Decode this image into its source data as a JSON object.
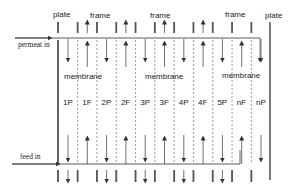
{
  "title_labels": {
    "plate_left": "plate",
    "frame_1": "frame",
    "frame_2": "frame",
    "frame_3": "frame",
    "plate_right": "plate"
  },
  "flows": {
    "permeat_in": "permeat in",
    "feed_in": "feed in"
  },
  "membrane_labels": [
    "membrane",
    "membrane",
    "membrane"
  ],
  "columns": [
    {
      "label": "1P",
      "type": "P"
    },
    {
      "label": "1F",
      "type": "F"
    },
    {
      "label": "2P",
      "type": "P"
    },
    {
      "label": "2F",
      "type": "F"
    },
    {
      "label": "3P",
      "type": "P"
    },
    {
      "label": "3F",
      "type": "F"
    },
    {
      "label": "4P",
      "type": "P"
    },
    {
      "label": "4F",
      "type": "F"
    },
    {
      "label": "5P",
      "type": "P"
    },
    {
      "label": "nF",
      "type": "F"
    },
    {
      "label": "nP",
      "type": "P"
    }
  ],
  "colors": {
    "line": "#333333",
    "bar": "#555555",
    "dashed": "#555555"
  }
}
